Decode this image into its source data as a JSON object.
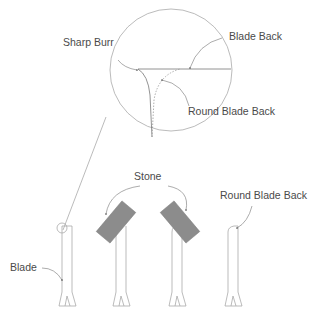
{
  "diagram": {
    "labels": {
      "sharp_burr": "Sharp Burr",
      "blade_back": "Blade Back",
      "round_blade_back_zoom": "Round Blade Back",
      "stone": "Stone",
      "round_blade_back": "Round Blade Back",
      "blade": "Blade"
    },
    "colors": {
      "line": "#9a9a9a",
      "stone_fill": "#8c8c8c",
      "text": "#4a4a4a"
    }
  }
}
